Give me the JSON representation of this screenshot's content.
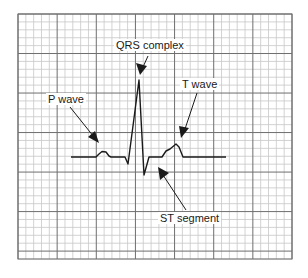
{
  "diagram": {
    "type": "ecg-waveform",
    "colors": {
      "background": "#ffffff",
      "grid_minor": "#c8c8c8",
      "grid_major": "#6e6e6e",
      "trace": "#1a1a1a"
    },
    "grid": {
      "left": 18,
      "top": 14,
      "right": 292,
      "bottom": 259,
      "minor_step": 7.83,
      "major_every": 5
    },
    "labels": {
      "p_wave": "P wave",
      "qrs_complex": "QRS complex",
      "t_wave": "T wave",
      "st_segment": "ST segment"
    }
  }
}
